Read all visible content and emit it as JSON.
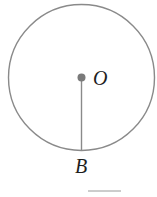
{
  "diagram": {
    "type": "circle-with-radius",
    "labels": {
      "center": "O",
      "point_on_circle": "B"
    },
    "colors": {
      "circle_stroke": "#8a8a8a",
      "center_dot": "#7a7a7a",
      "text": "#1e1e1e"
    }
  }
}
